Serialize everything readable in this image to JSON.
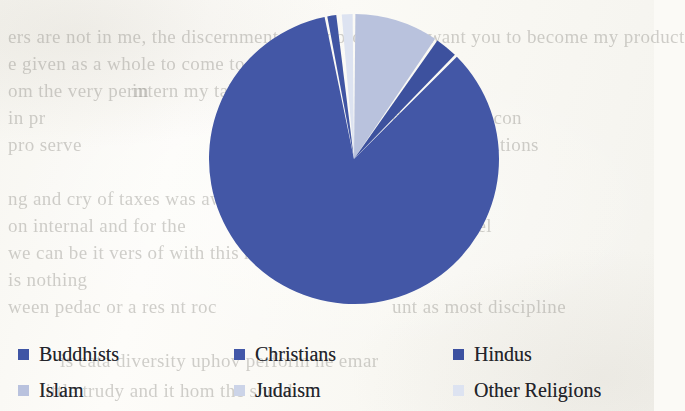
{
  "page": {
    "background_color": "#fbfaf6",
    "ghost_text_color": "#8c8a84",
    "bleed_lines": [
      {
        "text": "ers are not in  me, the discernment of my product",
        "x": 8,
        "y": 26,
        "size": 19
      },
      {
        "text": "is, I want you to become my product",
        "x": 392,
        "y": 26,
        "size": 19
      },
      {
        "text": "e given as a whole to come to make be",
        "x": 8,
        "y": 53,
        "size": 19
      },
      {
        "text": "om the very  perm",
        "x": 8,
        "y": 80,
        "size": 19
      },
      {
        "text": "intern   my taking los",
        "x": 132,
        "y": 80,
        "size": 19
      },
      {
        "text": "in   pr",
        "x": 8,
        "y": 107,
        "size": 19
      },
      {
        "text": "d ... Men — con",
        "x": 392,
        "y": 107,
        "size": 19
      },
      {
        "text": "pro  serve",
        "x": 8,
        "y": 134,
        "size": 19
      },
      {
        "text": "ess    acher  relations",
        "x": 392,
        "y": 134,
        "size": 19
      },
      {
        "text": "ng and cry of taxes was aware it has an on the",
        "x": 8,
        "y": 188,
        "size": 19
      },
      {
        "text": "on internal and for the",
        "x": 8,
        "y": 215,
        "size": 19
      },
      {
        "text": "l the lay  feel",
        "x": 392,
        "y": 215,
        "size": 19
      },
      {
        "text": "we can be it  vers of with  this respect",
        "x": 8,
        "y": 242,
        "size": 19
      },
      {
        "text": "is nothing",
        "x": 8,
        "y": 269,
        "size": 19
      },
      {
        "text": "ween    pedac or  a  res    nt  roc",
        "x": 8,
        "y": 296,
        "size": 19
      },
      {
        "text": "unt  as most  discipline",
        "x": 392,
        "y": 296,
        "size": 19
      },
      {
        "text": "is  cata   diversity    uphov  perform  ne  emar",
        "x": 60,
        "y": 350,
        "size": 19
      },
      {
        "text": "little  trudy and it    hom  the  shold",
        "x": 40,
        "y": 380,
        "size": 19
      }
    ]
  },
  "chart_data": {
    "type": "pie",
    "title": "",
    "legend_position": "bottom",
    "start_angle": -90,
    "direction": "clockwise",
    "categories": [
      "Buddhists",
      "Christians",
      "Hindus",
      "Islam",
      "Judaism",
      "Other Religions"
    ],
    "labels": [
      "Buddhists",
      "Christians",
      "Hindus",
      "Islam",
      "Judaism",
      "Other Religions"
    ],
    "values": [
      1.3,
      84.5,
      2.8,
      9.6,
      0.3,
      1.5
    ],
    "units": "percent",
    "colors": [
      "#3f55a5",
      "#4257a8",
      "#3c51a0",
      "#b9c2de",
      "#ccd4e8",
      "#dde3f1"
    ],
    "slices": [
      {
        "label": "Buddhists",
        "value": 1.3,
        "color": "#3f55a5",
        "start_deg": 346.4,
        "end_deg": 351.1
      },
      {
        "label": "Christians",
        "value": 84.5,
        "color": "#4257a8",
        "start_deg": 5.0,
        "end_deg": 309.2
      },
      {
        "label": "Hindus",
        "value": 2.8,
        "color": "#3c51a0",
        "start_deg": 0.9,
        "end_deg": 4.3
      },
      {
        "label": "Islam",
        "value": 9.6,
        "color": "#b9c2de",
        "start_deg": 351.8,
        "end_deg": 0.2
      },
      {
        "label": "Judaism",
        "value": 0.3,
        "color": "#ccd4e8",
        "start_deg": 345.6,
        "end_deg": 346.0
      },
      {
        "label": "Other Religions",
        "value": 1.5,
        "color": "#dde3f1",
        "start_deg": 343.5,
        "end_deg": 345.0
      }
    ],
    "geometry": {
      "cx": 146,
      "cy": 146,
      "r": 145,
      "gap_deg": 1.1
    }
  },
  "legend": {
    "rows": [
      [
        {
          "label": "Buddhists",
          "color": "#3f55a5"
        },
        {
          "label": "Christians",
          "color": "#4257a8"
        },
        {
          "label": "Hindus",
          "color": "#3c51a0"
        }
      ],
      [
        {
          "label": "Islam",
          "color": "#b9c2de"
        },
        {
          "label": "Judaism",
          "color": "#ccd4e8"
        },
        {
          "label": "Other Religions",
          "color": "#dde3f1"
        }
      ]
    ]
  }
}
